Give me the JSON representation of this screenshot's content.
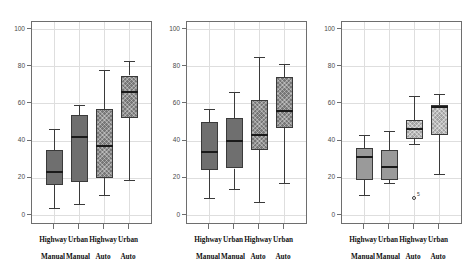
{
  "figure": {
    "type": "boxplot-panels",
    "panel_count": 3,
    "background": "#ffffff",
    "axis_color": "#6e6e6e",
    "grid_color": "#dedede",
    "box_edge_color": "#3a3a3a"
  },
  "axis": {
    "y_ticks": [
      100,
      80,
      60,
      40,
      20,
      0
    ],
    "y_tick_labels": [
      "100",
      "80",
      "60",
      "40",
      "20",
      "0"
    ],
    "ylim": [
      -5,
      108
    ],
    "ylabel": "",
    "xlabel": "",
    "grid": true
  },
  "categories": [
    {
      "line1": "Highway",
      "line2": "Manual"
    },
    {
      "line1": "Urban",
      "line2": "Manual"
    },
    {
      "line1": "Highway",
      "line2": "Auto"
    },
    {
      "line1": "Urban",
      "line2": "Auto"
    }
  ],
  "chart_data": {
    "type": "box",
    "title": "",
    "xlabel": "",
    "ylabel": "",
    "ylim": [
      -5,
      108
    ],
    "yticks": [
      0,
      20,
      40,
      60,
      80,
      100
    ],
    "grid": true,
    "categories": [
      "Highway Manual",
      "Urban Manual",
      "Highway Auto",
      "Urban Auto"
    ],
    "panels": [
      {
        "name": "panel-1",
        "boxes": [
          {
            "category": "Highway Manual",
            "whisker_low": 4,
            "q1": 16,
            "median": 23,
            "q3": 35,
            "whisker_high": 46,
            "fill": "solid",
            "outliers": []
          },
          {
            "category": "Urban Manual",
            "whisker_low": 6,
            "q1": 18,
            "median": 42,
            "q3": 54,
            "whisker_high": 59,
            "fill": "solid",
            "outliers": []
          },
          {
            "category": "Highway Auto",
            "whisker_low": 11,
            "q1": 20,
            "median": 37,
            "q3": 57,
            "whisker_high": 78,
            "fill": "hatch",
            "outliers": []
          },
          {
            "category": "Urban Auto",
            "whisker_low": 19,
            "q1": 52,
            "median": 66,
            "q3": 75,
            "whisker_high": 83,
            "fill": "hatch",
            "outliers": []
          }
        ]
      },
      {
        "name": "panel-2",
        "boxes": [
          {
            "category": "Highway Manual",
            "whisker_low": 9,
            "q1": 24,
            "median": 34,
            "q3": 50,
            "whisker_high": 57,
            "fill": "solid",
            "outliers": []
          },
          {
            "category": "Urban Manual",
            "whisker_low": 14,
            "q1": 25,
            "median": 40,
            "q3": 52,
            "whisker_high": 66,
            "fill": "solid",
            "outliers": []
          },
          {
            "category": "Highway Auto",
            "whisker_low": 7,
            "q1": 35,
            "median": 43,
            "q3": 62,
            "whisker_high": 85,
            "fill": "hatch",
            "outliers": []
          },
          {
            "category": "Urban Auto",
            "whisker_low": 17,
            "q1": 47,
            "median": 56,
            "q3": 74,
            "whisker_high": 81,
            "fill": "hatch",
            "outliers": []
          }
        ]
      },
      {
        "name": "panel-3",
        "boxes": [
          {
            "category": "Highway Manual",
            "whisker_low": 11,
            "q1": 19,
            "median": 31,
            "q3": 36,
            "whisker_high": 43,
            "fill": "light",
            "outliers": []
          },
          {
            "category": "Urban Manual",
            "whisker_low": 17,
            "q1": 19,
            "median": 26,
            "q3": 35,
            "whisker_high": 45,
            "fill": "light",
            "outliers": []
          },
          {
            "category": "Highway Auto",
            "whisker_low": 38,
            "q1": 41,
            "median": 46,
            "q3": 51,
            "whisker_high": 64,
            "fill": "lighthatch",
            "outliers": [
              {
                "value": 9,
                "label": "5"
              }
            ]
          },
          {
            "category": "Urban Auto",
            "whisker_low": 22,
            "q1": 43,
            "median": 58,
            "q3": 59,
            "whisker_high": 65,
            "fill": "lighthatch",
            "outliers": []
          }
        ]
      }
    ]
  }
}
